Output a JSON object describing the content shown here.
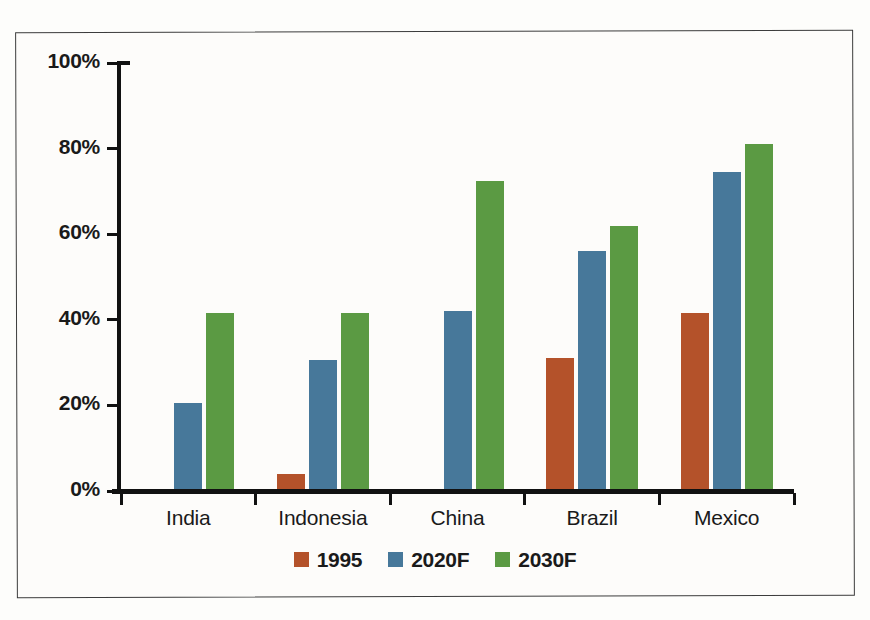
{
  "chart_data": {
    "type": "bar",
    "title": "",
    "subtitle": "",
    "xlabel": "",
    "ylabel": "",
    "ylim": [
      0,
      100
    ],
    "yticks": [
      0,
      20,
      40,
      60,
      80,
      100
    ],
    "ytick_labels": [
      "0%",
      "20%",
      "40%",
      "60%",
      "80%",
      "100%"
    ],
    "grid": false,
    "legend_position": "bottom-center",
    "value_suffix": "%",
    "categories": [
      "India",
      "Indonesia",
      "China",
      "Brazil",
      "Mexico"
    ],
    "series": [
      {
        "name": "1995",
        "color": "#b4522a",
        "values": [
          0.7,
          4.5,
          0,
          31.5,
          42
        ]
      },
      {
        "name": "2020F",
        "color": "#47789a",
        "values": [
          21,
          31,
          42.5,
          56.5,
          75
        ]
      },
      {
        "name": "2030F",
        "color": "#5b9a43",
        "values": [
          42,
          42,
          73,
          62.5,
          81.5
        ]
      }
    ]
  },
  "figure": {
    "background_color": "#fdfcfa",
    "border_color": "#3c3c3c",
    "axis_color": "#111111",
    "text_color": "#1a1a1a"
  }
}
